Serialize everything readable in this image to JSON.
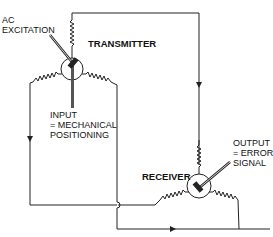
{
  "diagram": {
    "type": "synchro servo system schematic",
    "colors": {
      "line": "#222222",
      "background": "#ffffff"
    },
    "components": {
      "transmitter": {
        "label": "TRANSMITTER"
      },
      "receiver": {
        "label": "RECEIVER"
      }
    },
    "labels": {
      "ac_excitation": [
        "AC",
        "EXCITATION"
      ],
      "input": [
        "INPUT",
        "= MECHANICAL",
        "POSITIONING"
      ],
      "output": [
        "OUTPUT",
        "= ERROR",
        "SIGNAL"
      ]
    }
  }
}
